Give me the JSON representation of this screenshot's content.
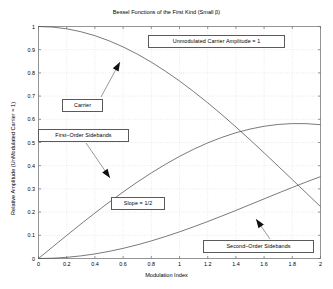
{
  "chart_data": {
    "type": "line",
    "title": "Bessel Functions of the First Kind (Small β)",
    "xlabel": "Modulation Index",
    "ylabel": "Relative Amplitude (UnModulated Carrier = 1)",
    "xlim": [
      0,
      2
    ],
    "ylim": [
      0,
      1
    ],
    "grid": true,
    "legend": "none",
    "xticks": [
      "0",
      "0.2",
      "0.4",
      "0.6",
      "0.8",
      "1",
      "1.2",
      "1.4",
      "1.6",
      "1.8",
      "2"
    ],
    "xtick_values": [
      0,
      0.2,
      0.4,
      0.6,
      0.8,
      1.0,
      1.2,
      1.4,
      1.6,
      1.8,
      2.0
    ],
    "yticks": [
      "0",
      "0.1",
      "0.2",
      "0.3",
      "0.4",
      "0.5",
      "0.6",
      "0.7",
      "0.8",
      "0.9",
      "1"
    ],
    "ytick_values": [
      0,
      0.1,
      0.2,
      0.3,
      0.4,
      0.5,
      0.6,
      0.7,
      0.8,
      0.9,
      1.0
    ],
    "x": [
      0,
      0.1,
      0.2,
      0.3,
      0.4,
      0.5,
      0.6,
      0.7,
      0.8,
      0.9,
      1.0,
      1.1,
      1.2,
      1.3,
      1.4,
      1.5,
      1.6,
      1.7,
      1.8,
      1.9,
      2.0
    ],
    "series": [
      {
        "name": "Carrier",
        "values": [
          1.0,
          0.9975,
          0.99,
          0.9776,
          0.9604,
          0.9385,
          0.912,
          0.8812,
          0.8463,
          0.8075,
          0.7652,
          0.7196,
          0.6711,
          0.6201,
          0.5669,
          0.5118,
          0.4554,
          0.398,
          0.34,
          0.2818,
          0.2239
        ]
      },
      {
        "name": "First-Order Sidebands",
        "values": [
          0.0,
          0.0499,
          0.0995,
          0.1483,
          0.196,
          0.2423,
          0.2867,
          0.329,
          0.3688,
          0.4059,
          0.4401,
          0.4709,
          0.4983,
          0.522,
          0.5419,
          0.5579,
          0.5699,
          0.5778,
          0.5815,
          0.5812,
          0.5767
        ]
      },
      {
        "name": "Second-Order Sidebands",
        "values": [
          0.0,
          0.0012,
          0.005,
          0.0112,
          0.0197,
          0.0306,
          0.0437,
          0.0588,
          0.0758,
          0.0946,
          0.1149,
          0.1366,
          0.1593,
          0.183,
          0.2073,
          0.2321,
          0.257,
          0.2819,
          0.3061,
          0.3301,
          0.3528
        ]
      }
    ],
    "annotations": [
      {
        "name": "unmodulated-carrier-amplitude",
        "text": "Unmodulated Carrier Amplitude = 1"
      },
      {
        "name": "carrier",
        "text": "Carrier"
      },
      {
        "name": "first-order-sidebands",
        "text": "First–Order Sidebands"
      },
      {
        "name": "slope",
        "text": "Slope = 1/2"
      },
      {
        "name": "second-order-sidebands",
        "text": "Second–Order Sidebands"
      }
    ]
  }
}
